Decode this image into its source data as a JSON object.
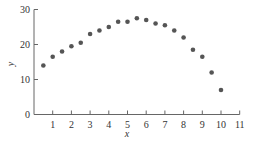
{
  "chart_data": {
    "type": "scatter",
    "title": "",
    "xlabel": "x",
    "ylabel": "y",
    "xlim": [
      0,
      11
    ],
    "ylim": [
      0,
      30
    ],
    "xticks": [
      1,
      2,
      3,
      4,
      5,
      6,
      7,
      8,
      9,
      10,
      11
    ],
    "yticks": [
      0,
      10,
      20,
      30
    ],
    "grid": false,
    "legend": null,
    "marker_color": "#555555",
    "series": [
      {
        "name": "data",
        "x": [
          0.5,
          1.0,
          1.5,
          2.0,
          2.5,
          3.0,
          3.5,
          4.0,
          4.5,
          5.0,
          5.5,
          6.0,
          6.5,
          7.0,
          7.5,
          8.0,
          8.5,
          9.0,
          9.5,
          10.0
        ],
        "y": [
          14,
          16.5,
          18,
          19.5,
          20.5,
          23,
          24,
          25,
          26.5,
          26.5,
          27.5,
          27,
          26,
          25.5,
          24,
          22,
          18.5,
          16.5,
          12,
          7
        ]
      }
    ]
  }
}
